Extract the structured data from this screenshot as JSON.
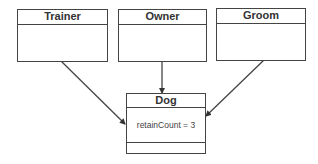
{
  "diagram": {
    "classes": [
      {
        "id": "trainer",
        "name": "Trainer"
      },
      {
        "id": "owner",
        "name": "Owner"
      },
      {
        "id": "groom",
        "name": "Groom"
      },
      {
        "id": "dog",
        "name": "Dog",
        "attribute": "retainCount = 3"
      }
    ],
    "edges": [
      {
        "from": "Trainer",
        "to": "Dog"
      },
      {
        "from": "Owner",
        "to": "Dog"
      },
      {
        "from": "Groom",
        "to": "Dog"
      }
    ],
    "colors": {
      "line": "#444444",
      "background": "#ffffff"
    }
  }
}
